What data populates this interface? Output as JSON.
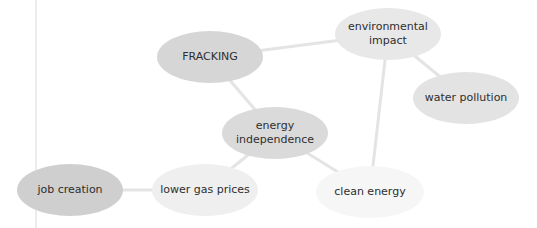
{
  "diagram": {
    "type": "concept-map",
    "edge_color": "#e4e4e4",
    "nodes": [
      {
        "id": "fracking",
        "label": "FRACKING",
        "cx": 210,
        "cy": 57,
        "w": 106,
        "h": 52,
        "fill": "#d6d6d6"
      },
      {
        "id": "environmental_impact",
        "label": "environmental impact",
        "cx": 388,
        "cy": 34,
        "w": 106,
        "h": 52,
        "fill": "#e8e8e8"
      },
      {
        "id": "water_pollution",
        "label": "water pollution",
        "cx": 466,
        "cy": 98,
        "w": 106,
        "h": 52,
        "fill": "#e3e3e3"
      },
      {
        "id": "energy_independence",
        "label": "energy independence",
        "cx": 275,
        "cy": 133,
        "w": 106,
        "h": 52,
        "fill": "#dadada"
      },
      {
        "id": "lower_gas_prices",
        "label": "lower gas prices",
        "cx": 205,
        "cy": 190,
        "w": 106,
        "h": 52,
        "fill": "#efefef"
      },
      {
        "id": "clean_energy",
        "label": "clean energy",
        "cx": 370,
        "cy": 192,
        "w": 108,
        "h": 52,
        "fill": "#f6f6f6"
      },
      {
        "id": "job_creation",
        "label": "job creation",
        "cx": 70,
        "cy": 190,
        "w": 106,
        "h": 52,
        "fill": "#cfcfcf"
      }
    ],
    "edges": [
      [
        "fracking",
        "environmental_impact"
      ],
      [
        "fracking",
        "energy_independence"
      ],
      [
        "environmental_impact",
        "water_pollution"
      ],
      [
        "environmental_impact",
        "clean_energy"
      ],
      [
        "energy_independence",
        "lower_gas_prices"
      ],
      [
        "energy_independence",
        "clean_energy"
      ],
      [
        "lower_gas_prices",
        "job_creation"
      ]
    ]
  }
}
